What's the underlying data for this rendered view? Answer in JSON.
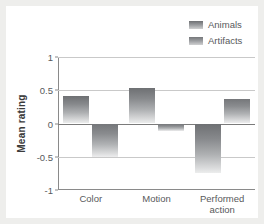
{
  "chart_data": {
    "type": "bar",
    "title": "",
    "xlabel": "",
    "ylabel": "Mean rating",
    "categories": [
      "Color",
      "Motion",
      "Performed\naction"
    ],
    "ylim": [
      -1,
      1
    ],
    "yticks": [
      "1",
      "0.5",
      "0",
      "-0.5",
      "-1"
    ],
    "ytick_values": [
      1,
      0.5,
      0,
      -0.5,
      -1
    ],
    "grid": true,
    "legend_position": "top-right",
    "series": [
      {
        "name": "Animals",
        "values": [
          0.42,
          0.53,
          -0.74
        ],
        "color": "#8a8c8f"
      },
      {
        "name": "Artifacts",
        "values": [
          -0.5,
          -0.11,
          0.37
        ],
        "color": "#9d9fa2"
      }
    ]
  },
  "legend": {
    "items": [
      {
        "label": "Animals",
        "swatch": "legend-swatch-animals"
      },
      {
        "label": "Artifacts",
        "swatch": "legend-swatch-artifacts"
      }
    ]
  },
  "colors": {
    "background": "#eeeeec",
    "panel": "#ffffff",
    "axis": "#8a8a8a",
    "gridline": "#c9c9c9",
    "zeroline": "#7b7b7b",
    "text": "#58595b",
    "title_text": "#3b3b3b"
  }
}
